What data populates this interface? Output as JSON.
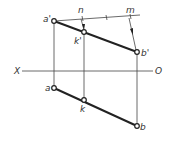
{
  "diagram": {
    "type": "descriptive-geometry-projection",
    "axis": {
      "left_label": "X",
      "right_label": "O"
    },
    "points": {
      "a_prime": {
        "label": "a'",
        "x": 54,
        "y": 21
      },
      "k_prime": {
        "label": "k'",
        "x": 84,
        "y": 32
      },
      "b_prime": {
        "label": "b'",
        "x": 137,
        "y": 52
      },
      "a": {
        "label": "a",
        "x": 54,
        "y": 88
      },
      "k": {
        "label": "k",
        "x": 84,
        "y": 100
      },
      "b": {
        "label": "b",
        "x": 137,
        "y": 126
      }
    },
    "ratio_line": {
      "n_label": "n",
      "m_label": "m"
    },
    "colors": {
      "line": "#222222",
      "background": "#ffffff"
    }
  }
}
